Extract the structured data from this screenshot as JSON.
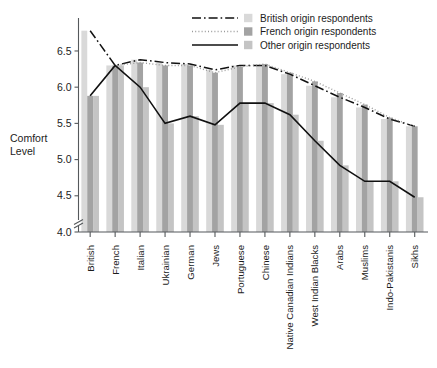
{
  "chart_data": {
    "type": "bar",
    "title": "",
    "subtitle": "",
    "xlabel": "",
    "ylabel": "Comfort Level",
    "ylabel_lines": [
      "Comfort",
      "Level"
    ],
    "ylim": [
      4.0,
      6.9
    ],
    "yticks": [
      4.0,
      4.5,
      5.0,
      5.5,
      6.0,
      6.5
    ],
    "ytick_labels": [
      "4.0",
      "4.5",
      "5.0",
      "5.5",
      "6.0",
      "6.5"
    ],
    "axis_break": true,
    "grid": false,
    "legend_position": "top-right",
    "categories": [
      "British",
      "French",
      "Italian",
      "Ukrainian",
      "German",
      "Jews",
      "Portuguese",
      "Chinese",
      "Native Canadian Indians",
      "West Indian Blacks",
      "Arabs",
      "Muslims",
      "Indo-Pakistanis",
      "Sikhs"
    ],
    "series": [
      {
        "name": "British origin respondents",
        "line_style": "dash-dot",
        "bar_color": "#d9d9d9",
        "values": [
          6.78,
          6.3,
          6.38,
          6.34,
          6.32,
          6.24,
          6.3,
          6.3,
          6.18,
          6.02,
          5.86,
          5.72,
          5.56,
          5.46
        ]
      },
      {
        "name": "French origin respondents",
        "line_style": "dotted",
        "bar_color": "#a3a3a3",
        "values": [
          5.88,
          6.3,
          6.34,
          6.3,
          6.3,
          6.2,
          6.28,
          6.32,
          6.2,
          6.08,
          5.92,
          5.76,
          5.58,
          5.46
        ]
      },
      {
        "name": "Other origin respondents",
        "line_style": "solid",
        "bar_color": "#c4c4c4",
        "values": [
          5.88,
          6.3,
          6.0,
          5.5,
          5.6,
          5.48,
          5.78,
          5.78,
          5.62,
          5.26,
          4.92,
          4.7,
          4.7,
          4.48
        ]
      }
    ]
  },
  "legend": {
    "entries": [
      {
        "label": "British origin respondents"
      },
      {
        "label": "French origin respondents"
      },
      {
        "label": "Other origin respondents"
      }
    ]
  }
}
